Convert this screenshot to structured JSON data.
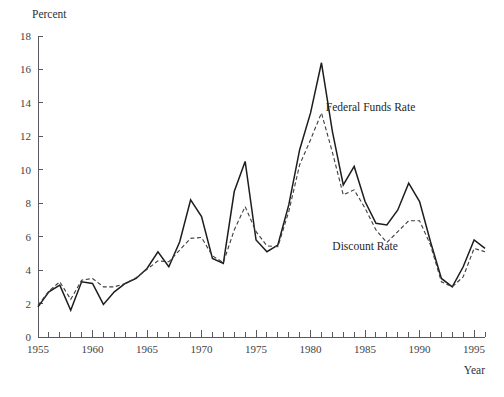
{
  "chart_data": {
    "type": "line",
    "title": "",
    "xlabel": "Year",
    "ylabel": "Percent",
    "ylim": [
      0,
      18
    ],
    "xlim": [
      1955,
      1996
    ],
    "grid": false,
    "ytick_step": 2,
    "yticks": [
      0,
      2,
      4,
      6,
      8,
      10,
      12,
      14,
      16,
      18
    ],
    "ytick_labels": [
      "0",
      "2",
      "4",
      "6",
      "8",
      "10",
      "12",
      "14",
      "16",
      "18"
    ],
    "xticks": [
      1955,
      1960,
      1965,
      1970,
      1975,
      1980,
      1985,
      1990,
      1995
    ],
    "xtick_labels": [
      "1955",
      "1960",
      "1965",
      "1970",
      "1975",
      "1980",
      "1985",
      "1990",
      "1995"
    ],
    "x_minor_tick_step": 1,
    "legend_position": "inline-annotations",
    "annotations": [
      {
        "text": "Federal Funds Rate",
        "x": 1981.4,
        "y": 13.5,
        "series": "Federal Funds Rate"
      },
      {
        "text": "Discount Rate",
        "x": 1982.0,
        "y": 5.2,
        "series": "Discount Rate"
      }
    ],
    "x": [
      1955,
      1956,
      1957,
      1958,
      1959,
      1960,
      1961,
      1962,
      1963,
      1964,
      1965,
      1966,
      1967,
      1968,
      1969,
      1970,
      1971,
      1972,
      1973,
      1974,
      1975,
      1976,
      1977,
      1978,
      1979,
      1980,
      1981,
      1982,
      1983,
      1984,
      1985,
      1986,
      1987,
      1988,
      1989,
      1990,
      1991,
      1992,
      1993,
      1994,
      1995,
      1996
    ],
    "series": [
      {
        "name": "Federal Funds Rate",
        "style": "solid",
        "color": "#1d1d1f",
        "values": [
          1.8,
          2.7,
          3.1,
          1.6,
          3.3,
          3.2,
          1.95,
          2.7,
          3.2,
          3.5,
          4.1,
          5.1,
          4.2,
          5.7,
          8.2,
          7.2,
          4.7,
          4.4,
          8.7,
          10.5,
          5.8,
          5.1,
          5.5,
          7.9,
          11.2,
          13.4,
          16.4,
          12.3,
          9.1,
          10.2,
          8.1,
          6.8,
          6.7,
          7.6,
          9.2,
          8.1,
          5.7,
          3.5,
          3.0,
          4.2,
          5.8,
          5.3
        ]
      },
      {
        "name": "Discount Rate",
        "style": "dashed",
        "color": "#3d3d42",
        "values": [
          1.9,
          2.75,
          3.3,
          2.25,
          3.4,
          3.5,
          3.0,
          3.0,
          3.2,
          3.55,
          4.05,
          4.55,
          4.5,
          5.2,
          5.9,
          5.95,
          4.85,
          4.45,
          6.4,
          7.8,
          6.3,
          5.45,
          5.4,
          7.5,
          10.3,
          11.8,
          13.4,
          11.05,
          8.5,
          8.8,
          7.7,
          6.4,
          5.65,
          6.3,
          6.95,
          6.95,
          5.5,
          3.3,
          3.0,
          3.6,
          5.3,
          5.1
        ]
      }
    ]
  },
  "labels": {
    "y_axis_title": "Percent",
    "x_axis_title": "Year"
  },
  "caption": {
    "ghost_text": ""
  }
}
